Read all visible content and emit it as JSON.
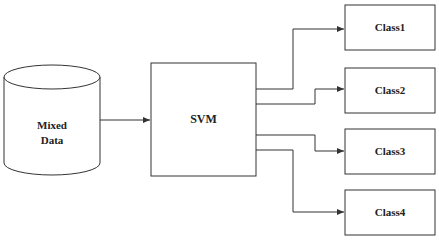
{
  "diagram": {
    "source": {
      "label_line1": "Mixed",
      "label_line2": "Data",
      "shape": "cylinder"
    },
    "classifier": {
      "label": "SVM"
    },
    "outputs": [
      {
        "label": "Class1"
      },
      {
        "label": "Class2"
      },
      {
        "label": "Class3"
      },
      {
        "label": "Class4"
      }
    ],
    "colors": {
      "stroke": "#333333",
      "background": "#ffffff",
      "text": "#222222"
    }
  }
}
